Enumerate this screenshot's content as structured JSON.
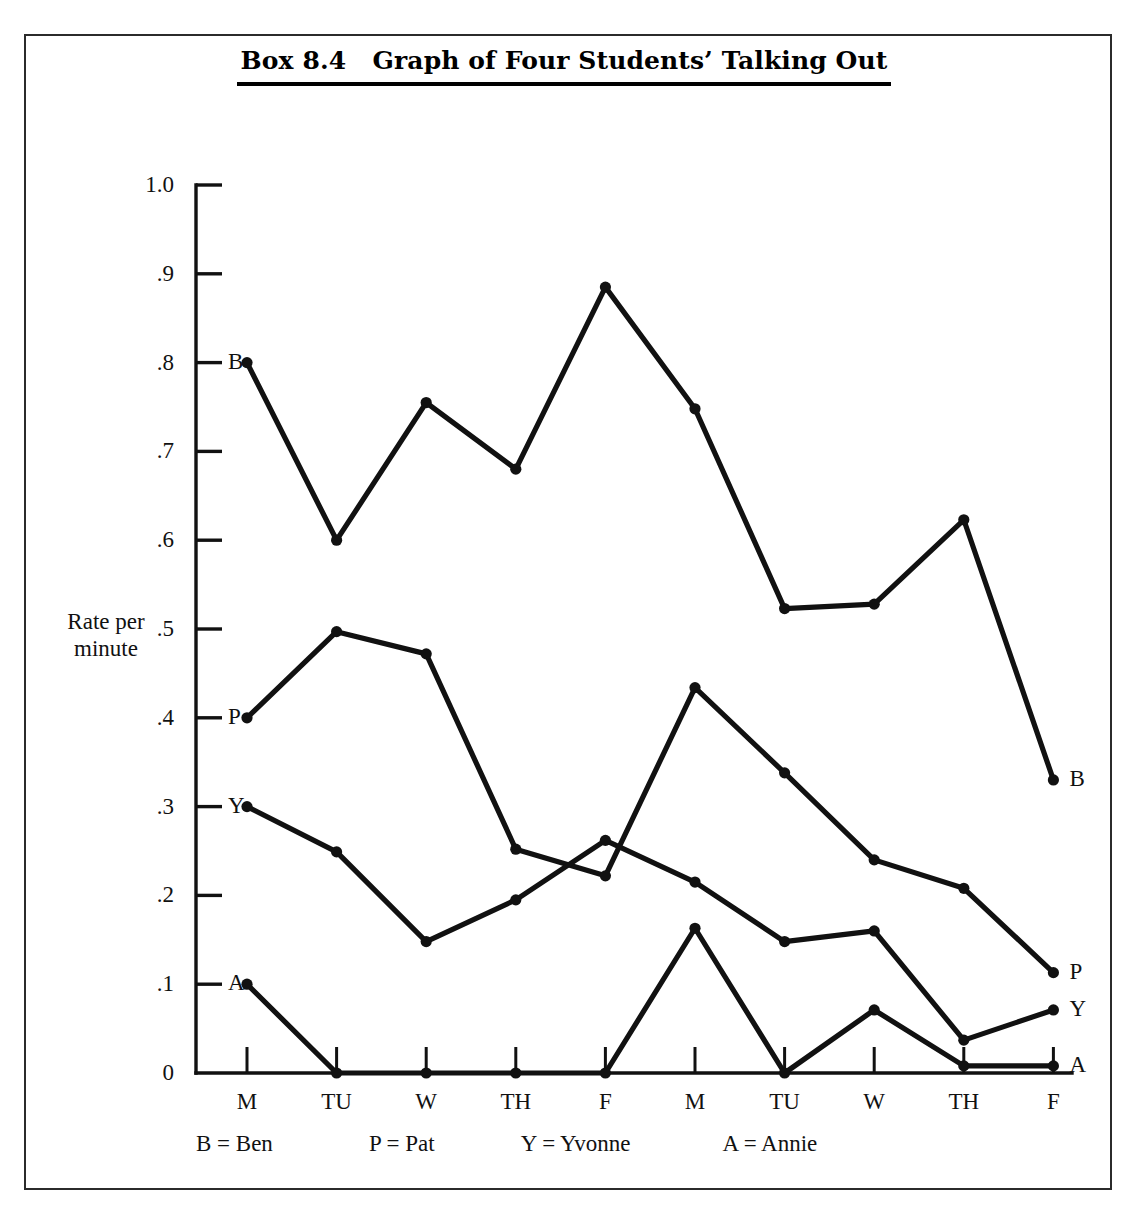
{
  "title": "Box 8.4   Graph of Four Students’ Talking Out",
  "axis": {
    "y_caption_line1": "Rate per",
    "y_caption_line2": "minute",
    "y_ticks": [
      "1.0",
      ".9",
      ".8",
      ".7",
      ".6",
      ".5",
      ".4",
      ".3",
      ".2",
      ".1",
      "0"
    ],
    "x_ticks": [
      "M",
      "TU",
      "W",
      "TH",
      "F",
      "M",
      "TU",
      "W",
      "TH",
      "F"
    ]
  },
  "series_start_labels": [
    {
      "key": "B",
      "text": "B"
    },
    {
      "key": "P",
      "text": "P"
    },
    {
      "key": "Y",
      "text": "Y"
    },
    {
      "key": "A",
      "text": "A"
    }
  ],
  "series_end_labels": [
    {
      "key": "B",
      "text": "B"
    },
    {
      "key": "P",
      "text": "P"
    },
    {
      "key": "Y",
      "text": "Y"
    },
    {
      "key": "A",
      "text": "A"
    }
  ],
  "legend": [
    {
      "key": "B",
      "text": "B = Ben"
    },
    {
      "key": "P",
      "text": "P = Pat"
    },
    {
      "key": "Y",
      "text": "Y = Yvonne"
    },
    {
      "key": "A",
      "text": "A = Annie"
    }
  ],
  "colors": {
    "line": "#111111",
    "frame": "#2b2b2b",
    "text": "#111111"
  },
  "chart_data": {
    "type": "line",
    "title": "Box 8.4   Graph of Four Students’ Talking Out",
    "xlabel": "",
    "ylabel": "Rate per minute",
    "ylim": [
      0,
      1.0
    ],
    "ytick_values": [
      1.0,
      0.9,
      0.8,
      0.7,
      0.6,
      0.5,
      0.4,
      0.3,
      0.2,
      0.1,
      0
    ],
    "categories": [
      "M",
      "TU",
      "W",
      "TH",
      "F",
      "M",
      "TU",
      "W",
      "TH",
      "F"
    ],
    "grid": false,
    "legend_position": "below-axis",
    "series": [
      {
        "name": "Ben",
        "key": "B",
        "values": [
          0.8,
          0.6,
          0.755,
          0.68,
          0.885,
          0.748,
          0.523,
          0.528,
          0.623,
          0.33
        ]
      },
      {
        "name": "Pat",
        "key": "P",
        "values": [
          0.4,
          0.497,
          0.472,
          0.252,
          0.222,
          0.434,
          0.338,
          0.24,
          0.208,
          0.113
        ]
      },
      {
        "name": "Yvonne",
        "key": "Y",
        "values": [
          0.3,
          0.249,
          0.148,
          0.195,
          0.262,
          0.215,
          0.148,
          0.16,
          0.037,
          0.071
        ]
      },
      {
        "name": "Annie",
        "key": "A",
        "values": [
          0.1,
          0.0,
          0.0,
          0.0,
          0.0,
          0.163,
          0.0,
          0.071,
          0.008,
          0.008
        ]
      }
    ]
  }
}
